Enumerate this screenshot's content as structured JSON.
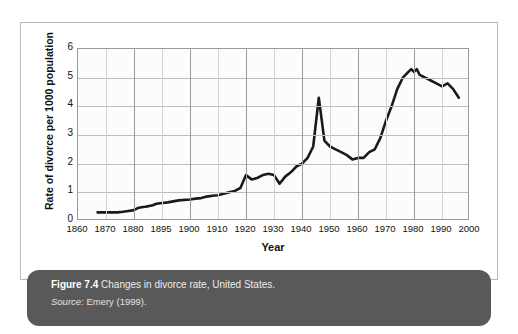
{
  "figure": {
    "caption_label": "Figure 7.4",
    "caption_text": "Changes in divorce rate, United States.",
    "source_label": "Source:",
    "source_text": "Emery (1999)."
  },
  "chart_data": {
    "type": "line",
    "title": "",
    "xlabel": "Year",
    "ylabel": "Rate of divorce per 1000 population",
    "xlim": [
      1860,
      2000
    ],
    "ylim": [
      0,
      6
    ],
    "yticks": [
      0,
      1,
      2,
      3,
      4,
      5,
      6
    ],
    "xtick_labels": [
      "1860",
      "1870",
      "1880",
      "1895",
      "1900",
      "1910",
      "1920",
      "1930",
      "1940",
      "1950",
      "1960",
      "1970",
      "1980",
      "1990",
      "2000"
    ],
    "grid": true,
    "legend": "none",
    "line_color": "#1a1a1a",
    "series": [
      {
        "name": "Divorce rate per 1000 population",
        "x": [
          1867,
          1870,
          1872,
          1874,
          1876,
          1878,
          1880,
          1882,
          1884,
          1886,
          1888,
          1890,
          1892,
          1894,
          1896,
          1898,
          1900,
          1902,
          1904,
          1906,
          1908,
          1910,
          1912,
          1914,
          1916,
          1918,
          1920,
          1922,
          1924,
          1926,
          1928,
          1930,
          1932,
          1934,
          1936,
          1938,
          1940,
          1942,
          1944,
          1946,
          1948,
          1950,
          1952,
          1954,
          1956,
          1958,
          1960,
          1962,
          1964,
          1966,
          1968,
          1970,
          1972,
          1974,
          1976,
          1978,
          1979,
          1980,
          1981,
          1982,
          1984,
          1986,
          1988,
          1990,
          1992,
          1994,
          1996
        ],
        "y": [
          0.3,
          0.3,
          0.3,
          0.3,
          0.32,
          0.35,
          0.38,
          0.45,
          0.48,
          0.5,
          0.52,
          0.55,
          0.6,
          0.62,
          0.65,
          0.72,
          0.75,
          0.78,
          0.8,
          0.85,
          0.88,
          0.9,
          0.95,
          1.0,
          1.05,
          1.15,
          1.6,
          1.45,
          1.5,
          1.6,
          1.65,
          1.6,
          1.3,
          1.55,
          1.7,
          1.9,
          2.0,
          2.2,
          2.6,
          4.3,
          2.8,
          2.6,
          2.5,
          2.4,
          2.3,
          2.15,
          2.2,
          2.2,
          2.4,
          2.5,
          2.9,
          3.5,
          4.0,
          4.6,
          5.0,
          5.2,
          5.3,
          5.2,
          5.3,
          5.1,
          5.0,
          4.9,
          4.8,
          4.7,
          4.8,
          4.6,
          4.3
        ]
      }
    ],
    "annotations": [
      {
        "label": "post-WWII spike",
        "x": 1946,
        "y": 4.3
      },
      {
        "label": "Great Depression dip",
        "x": 1932,
        "y": 1.3
      },
      {
        "label": "peak",
        "x": 1981,
        "y": 5.3
      }
    ]
  }
}
